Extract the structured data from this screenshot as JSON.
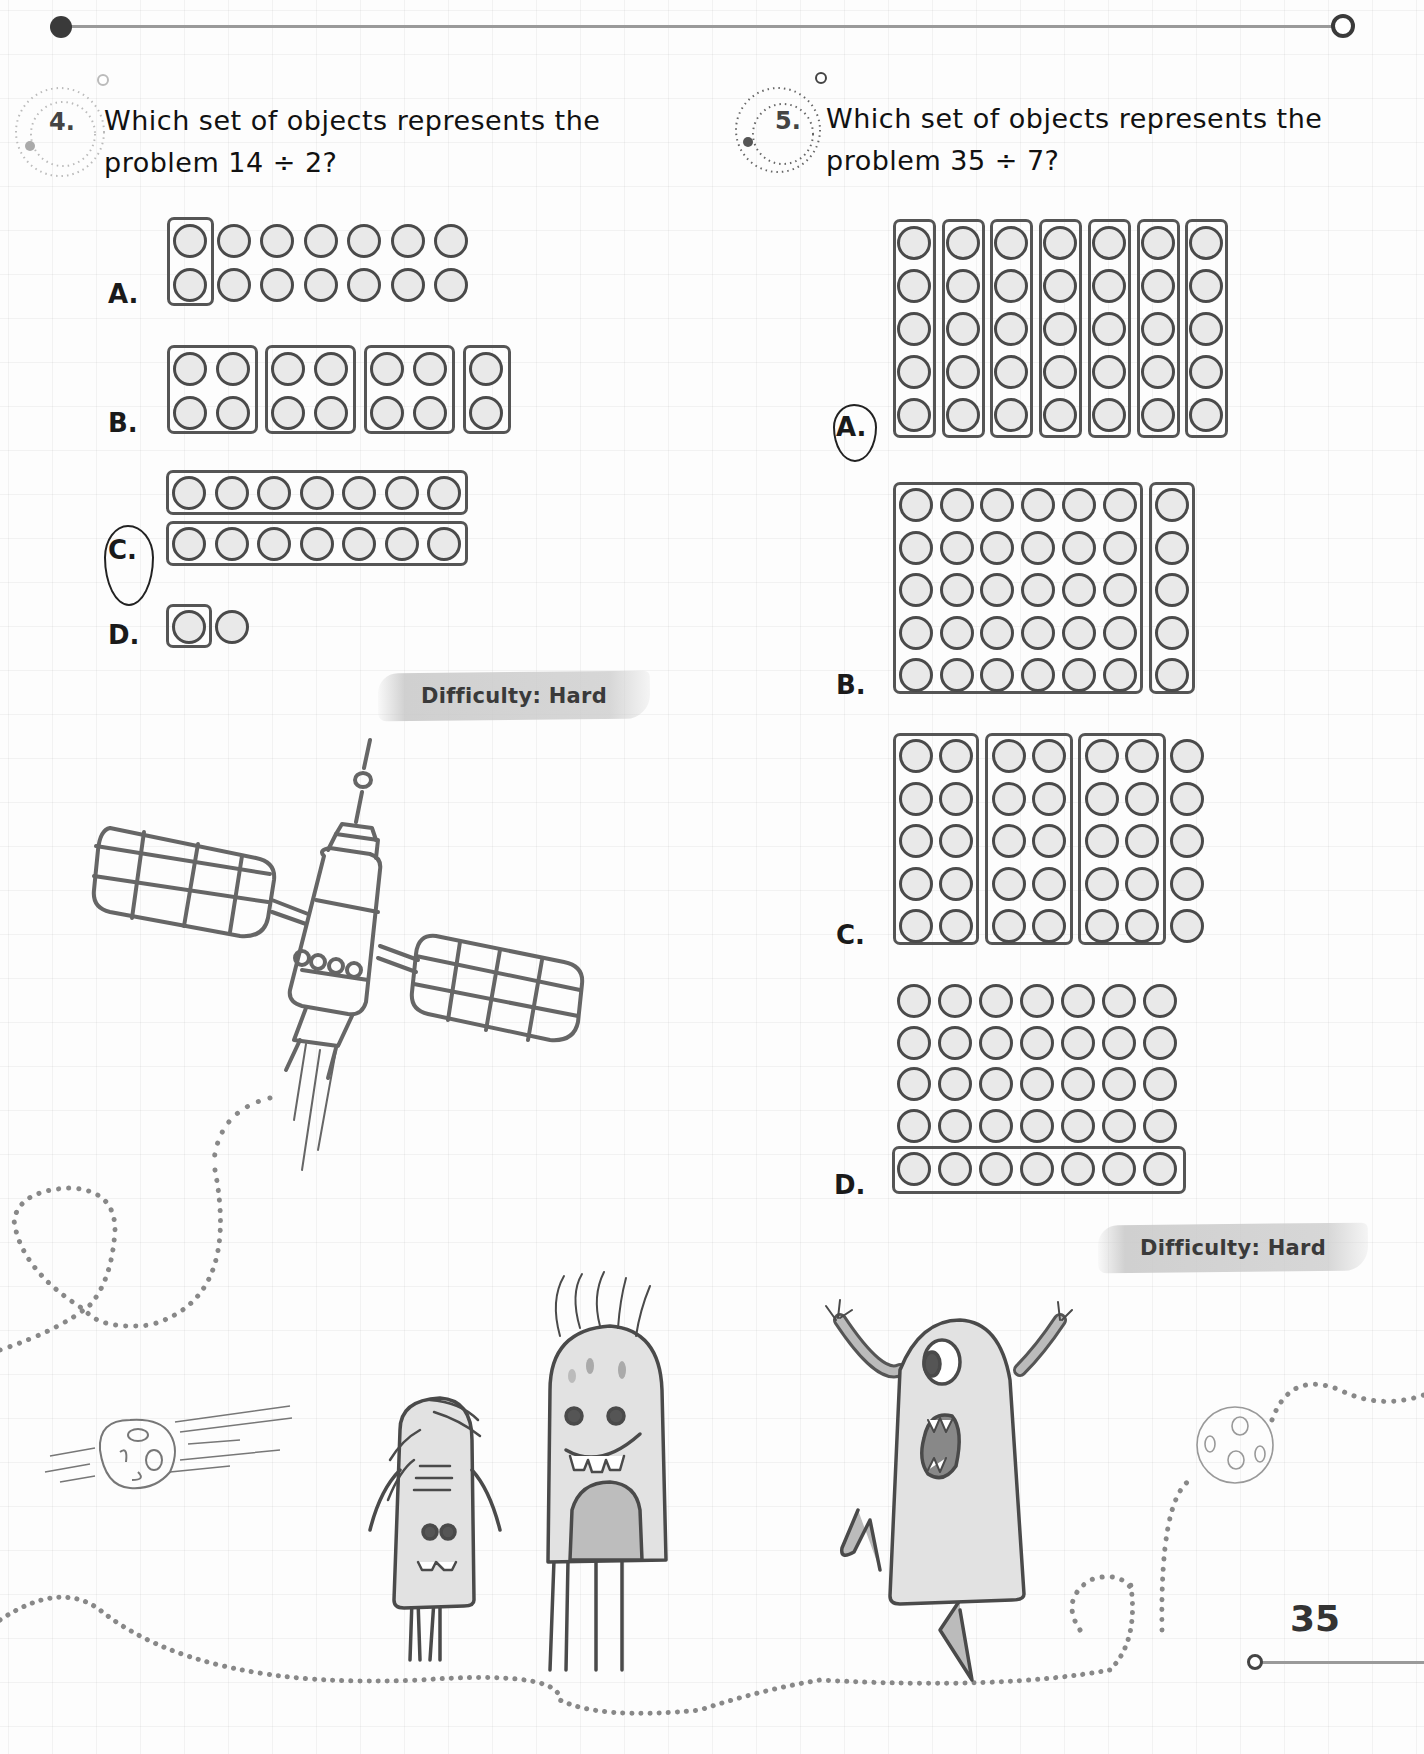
{
  "page": {
    "number": "35",
    "accent_color": "#3a3a3a",
    "grid_color": "#e6e6e6"
  },
  "questions": [
    {
      "number": "4.",
      "text_line1": "Which set of objects represents the",
      "text_line2": "problem 14 ÷ 2?",
      "dividend": 14,
      "divisor": 2,
      "difficulty": "Difficulty: Hard",
      "selected_option": "C",
      "options": [
        {
          "label": "A.",
          "description": "14 circles in 2 rows of 7; only the first column of 2 is boxed"
        },
        {
          "label": "B.",
          "description": "14 circles in 2 rows; boxed into groups of 4, 4, 4 and 2"
        },
        {
          "label": "C.",
          "description": "2 boxed rows of 7 circles each"
        },
        {
          "label": "D.",
          "description": "2 circles; one boxed"
        }
      ]
    },
    {
      "number": "5.",
      "text_line1": "Which set of objects represents the",
      "text_line2": "problem 35 ÷ 7?",
      "dividend": 35,
      "divisor": 7,
      "difficulty": "Difficulty: Hard",
      "selected_option": "A",
      "options": [
        {
          "label": "A.",
          "description": "7 boxed columns of 5 circles each"
        },
        {
          "label": "B.",
          "description": "5 rows of 7; a box around 6 columns and a box around the last column"
        },
        {
          "label": "C.",
          "description": "5 rows of 7; boxed into 3 groups of 2 columns, last column unboxed"
        },
        {
          "label": "D.",
          "description": "5 rows of 7 circles; only the bottom row boxed"
        }
      ]
    }
  ],
  "illustrations": [
    {
      "name": "satellite",
      "description": "line drawing of a satellite with two solar panels and exhaust trail"
    },
    {
      "name": "asteroid-left",
      "description": "cratered asteroid with motion lines"
    },
    {
      "name": "moon-right",
      "description": "cratered moon on dotted path"
    },
    {
      "name": "monster-short",
      "description": "short monster with hair, two eyes, toothy smile"
    },
    {
      "name": "monster-tall",
      "description": "tall spotted monster with antennae and four legs"
    },
    {
      "name": "monster-jumping",
      "description": "one-eyed jumping monster with raised arms"
    }
  ]
}
